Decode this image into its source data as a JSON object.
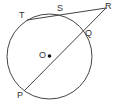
{
  "diagram": {
    "labels": {
      "T": "T",
      "S": "S",
      "R": "R",
      "Q": "Q",
      "O": "O",
      "P": "P"
    },
    "circle": {
      "cx": 49.5,
      "cy": 56.5,
      "r": 42.5,
      "color": "#444444"
    },
    "segments": [
      {
        "from": "T",
        "to": "R"
      },
      {
        "from": "P",
        "to": "R"
      }
    ]
  }
}
